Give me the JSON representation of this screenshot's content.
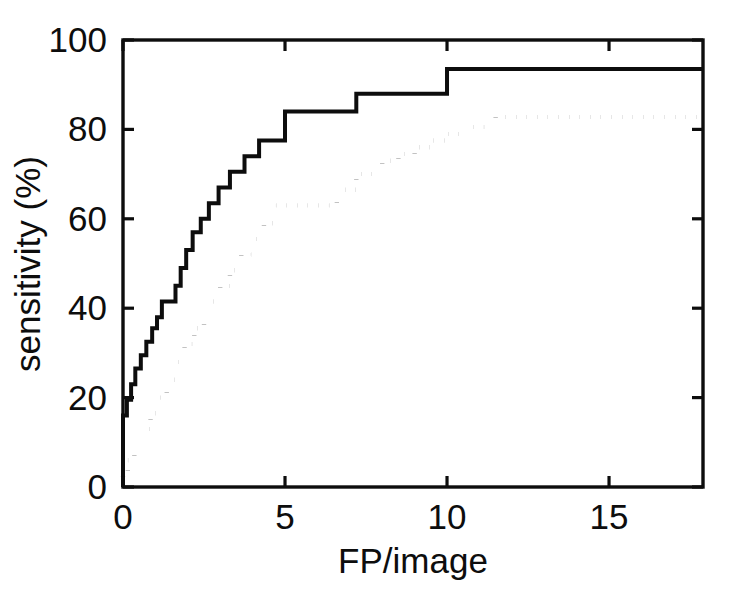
{
  "chart_data": {
    "type": "line",
    "title": "",
    "subtitle": "",
    "xlabel": "FP/image",
    "ylabel": "sensitivity (%)",
    "xlim": [
      0,
      17.9
    ],
    "ylim": [
      0,
      100
    ],
    "grid": false,
    "legend": null,
    "xticks": [
      0,
      5,
      10,
      15
    ],
    "xtick_labels": [
      "0",
      "5",
      "10",
      "15"
    ],
    "yticks": [
      0,
      20,
      40,
      60,
      80,
      100
    ],
    "ytick_labels": [
      "0",
      "20",
      "40",
      "60",
      "80",
      "100"
    ],
    "box": true,
    "ticks_all_sides": true,
    "annotations": [],
    "series": [
      {
        "name": "solid-curve",
        "style": "solid",
        "drawstyle": "steps-post",
        "color": "#0d0d0d",
        "x": [
          0.0,
          0.0,
          0.12,
          0.25,
          0.38,
          0.55,
          0.72,
          0.9,
          1.05,
          1.2,
          1.35,
          1.5,
          1.62,
          1.78,
          1.95,
          2.15,
          2.4,
          2.65,
          2.95,
          3.3,
          3.75,
          4.2,
          5.0,
          7.2,
          10.0,
          17.9
        ],
        "y": [
          0.0,
          16.0,
          19.5,
          23.0,
          26.5,
          29.5,
          32.5,
          35.5,
          38.0,
          41.5,
          41.5,
          41.5,
          45.0,
          49.0,
          53.0,
          57.0,
          60.0,
          63.5,
          67.0,
          70.5,
          74.0,
          77.5,
          84.0,
          88.0,
          93.5,
          93.5
        ]
      },
      {
        "name": "dotted-curve",
        "style": "dotted",
        "drawstyle": "steps-post",
        "color": "#0d0d0d",
        "x": [
          0.0,
          0.0,
          0.15,
          0.35,
          0.6,
          0.85,
          1.1,
          1.35,
          1.6,
          1.9,
          2.2,
          2.5,
          2.75,
          3.0,
          3.3,
          3.65,
          4.0,
          4.35,
          4.7,
          5.0,
          6.2,
          6.6,
          7.2,
          7.6,
          8.0,
          8.5,
          9.0,
          9.5,
          10.0,
          10.6,
          11.2,
          11.5,
          17.9
        ],
        "y": [
          0.0,
          3.5,
          6.0,
          9.5,
          13.0,
          16.5,
          20.0,
          24.0,
          28.0,
          32.0,
          35.5,
          41.5,
          41.5,
          45.0,
          48.5,
          52.0,
          55.5,
          59.0,
          63.0,
          63.0,
          63.0,
          66.5,
          70.0,
          70.0,
          73.0,
          74.5,
          76.0,
          77.5,
          79.0,
          80.5,
          82.5,
          82.8,
          82.8
        ]
      }
    ]
  },
  "figure": {
    "background_color": "#ffffff",
    "axis_color": "#0d0d0d"
  }
}
